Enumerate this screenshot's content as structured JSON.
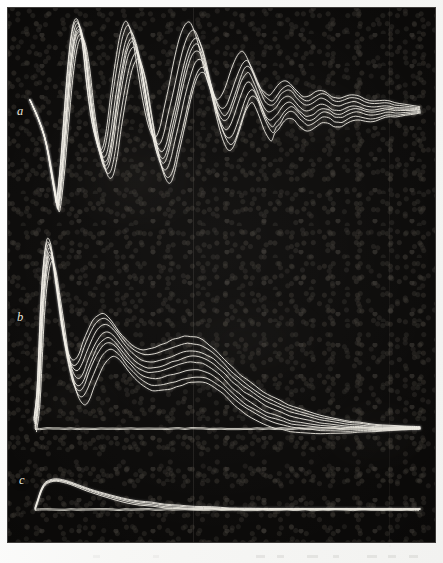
{
  "figure": {
    "kind": "photographic-oscilloscope-plate",
    "background_color": "#0a0908",
    "trace_color": "#f2efe6",
    "paper_color": "#fbfbfa",
    "plate": {
      "x": 8,
      "y": 8,
      "width": 427,
      "height": 534
    },
    "panels": [
      {
        "id": "a",
        "label": "a"
      },
      {
        "id": "b",
        "label": "b"
      },
      {
        "id": "c",
        "label": "c"
      }
    ]
  },
  "chart_data": {
    "type": "line",
    "title": "",
    "subtitle": "",
    "xlabel": "",
    "ylabel": "",
    "grid": false,
    "legend": "none",
    "panels": [
      {
        "id": "a",
        "label": "a",
        "sweeps": 8,
        "baseline_y": 110,
        "xlim": [
          30,
          420
        ],
        "ylim": [
          10,
          215
        ],
        "note": "damped ringing, ~5 visible full cycles then fine ripple",
        "points": [
          [
            30,
            100
          ],
          [
            38,
            118
          ],
          [
            44,
            135
          ],
          [
            48,
            152
          ],
          [
            52,
            175
          ],
          [
            56,
            198
          ],
          [
            58,
            205
          ],
          [
            62,
            170
          ],
          [
            66,
            120
          ],
          [
            70,
            72
          ],
          [
            74,
            40
          ],
          [
            78,
            28
          ],
          [
            82,
            34
          ],
          [
            86,
            58
          ],
          [
            90,
            95
          ],
          [
            95,
            130
          ],
          [
            100,
            152
          ],
          [
            104,
            163
          ],
          [
            108,
            160
          ],
          [
            112,
            140
          ],
          [
            116,
            110
          ],
          [
            121,
            78
          ],
          [
            126,
            52
          ],
          [
            131,
            40
          ],
          [
            135,
            44
          ],
          [
            140,
            62
          ],
          [
            145,
            92
          ],
          [
            150,
            122
          ],
          [
            155,
            145
          ],
          [
            160,
            158
          ],
          [
            164,
            160
          ],
          [
            168,
            150
          ],
          [
            172,
            132
          ],
          [
            177,
            110
          ],
          [
            182,
            86
          ],
          [
            187,
            66
          ],
          [
            192,
            52
          ],
          [
            197,
            48
          ],
          [
            201,
            54
          ],
          [
            206,
            70
          ],
          [
            211,
            92
          ],
          [
            216,
            110
          ],
          [
            221,
            122
          ],
          [
            225,
            126
          ],
          [
            229,
            122
          ],
          [
            233,
            112
          ],
          [
            237,
            100
          ],
          [
            241,
            88
          ],
          [
            245,
            80
          ],
          [
            249,
            78
          ],
          [
            253,
            84
          ],
          [
            257,
            94
          ],
          [
            261,
            104
          ],
          [
            265,
            112
          ],
          [
            269,
            116
          ],
          [
            273,
            114
          ],
          [
            277,
            110
          ],
          [
            281,
            104
          ],
          [
            285,
            100
          ],
          [
            289,
            99
          ],
          [
            293,
            101
          ],
          [
            297,
            106
          ],
          [
            301,
            110
          ],
          [
            305,
            113
          ],
          [
            309,
            113
          ],
          [
            313,
            111
          ],
          [
            317,
            108
          ],
          [
            321,
            106
          ],
          [
            325,
            106
          ],
          [
            329,
            108
          ],
          [
            333,
            111
          ],
          [
            337,
            112
          ],
          [
            341,
            112
          ],
          [
            345,
            110
          ],
          [
            350,
            108
          ],
          [
            355,
            107
          ],
          [
            360,
            108
          ],
          [
            365,
            110
          ],
          [
            370,
            111
          ],
          [
            375,
            111
          ],
          [
            380,
            110
          ],
          [
            385,
            109
          ],
          [
            390,
            109
          ],
          [
            395,
            110
          ],
          [
            400,
            110
          ],
          [
            405,
            110
          ],
          [
            410,
            110
          ],
          [
            415,
            110
          ],
          [
            420,
            110
          ]
        ]
      },
      {
        "id": "b",
        "label": "b",
        "sweeps": 8,
        "baseline_y": 428,
        "xlim": [
          35,
          420
        ],
        "ylim": [
          245,
          430
        ],
        "note": "large initial spike, damped secondary humps, long exponential decay to baseline",
        "points": [
          [
            35,
            425
          ],
          [
            38,
            400
          ],
          [
            40,
            360
          ],
          [
            42,
            315
          ],
          [
            44,
            285
          ],
          [
            46,
            265
          ],
          [
            48,
            253
          ],
          [
            50,
            250
          ],
          [
            53,
            258
          ],
          [
            56,
            278
          ],
          [
            60,
            305
          ],
          [
            64,
            334
          ],
          [
            68,
            356
          ],
          [
            72,
            372
          ],
          [
            76,
            380
          ],
          [
            80,
            381
          ],
          [
            84,
            375
          ],
          [
            88,
            364
          ],
          [
            93,
            352
          ],
          [
            98,
            342
          ],
          [
            103,
            336
          ],
          [
            108,
            334
          ],
          [
            113,
            337
          ],
          [
            118,
            343
          ],
          [
            124,
            351
          ],
          [
            130,
            358
          ],
          [
            136,
            364
          ],
          [
            142,
            368
          ],
          [
            148,
            370
          ],
          [
            154,
            370
          ],
          [
            160,
            369
          ],
          [
            166,
            367
          ],
          [
            172,
            365
          ],
          [
            178,
            363
          ],
          [
            184,
            361
          ],
          [
            190,
            360
          ],
          [
            196,
            360
          ],
          [
            202,
            361
          ],
          [
            208,
            364
          ],
          [
            214,
            368
          ],
          [
            220,
            373
          ],
          [
            226,
            379
          ],
          [
            232,
            385
          ],
          [
            238,
            390
          ],
          [
            244,
            395
          ],
          [
            250,
            399
          ],
          [
            258,
            404
          ],
          [
            266,
            409
          ],
          [
            274,
            412
          ],
          [
            282,
            415
          ],
          [
            290,
            418
          ],
          [
            300,
            420
          ],
          [
            310,
            422
          ],
          [
            320,
            424
          ],
          [
            330,
            425
          ],
          [
            340,
            426
          ],
          [
            350,
            427
          ],
          [
            360,
            427
          ],
          [
            375,
            428
          ],
          [
            390,
            428
          ],
          [
            405,
            428
          ],
          [
            420,
            428
          ]
        ]
      },
      {
        "id": "c",
        "label": "c",
        "sweeps": 4,
        "baseline_y": 509,
        "xlim": [
          35,
          420
        ],
        "ylim": [
          478,
          512
        ],
        "note": "small slow rounded pulse relaxing back onto baseline",
        "points": [
          [
            35,
            509
          ],
          [
            38,
            500
          ],
          [
            41,
            491
          ],
          [
            45,
            484
          ],
          [
            50,
            481
          ],
          [
            56,
            480
          ],
          [
            63,
            481
          ],
          [
            70,
            483
          ],
          [
            78,
            486
          ],
          [
            86,
            489
          ],
          [
            95,
            492
          ],
          [
            105,
            495
          ],
          [
            116,
            498
          ],
          [
            128,
            501
          ],
          [
            140,
            503
          ],
          [
            152,
            504
          ],
          [
            165,
            506
          ],
          [
            180,
            507
          ],
          [
            195,
            508
          ],
          [
            212,
            508
          ],
          [
            230,
            509
          ],
          [
            250,
            509
          ],
          [
            275,
            509
          ],
          [
            300,
            509
          ],
          [
            330,
            509
          ],
          [
            360,
            509
          ],
          [
            390,
            509
          ],
          [
            420,
            509
          ]
        ]
      }
    ],
    "baselines": [
      {
        "panel": "b",
        "y": 428,
        "x0": 35,
        "x1": 420
      },
      {
        "panel": "c",
        "y": 509,
        "x0": 35,
        "x1": 420
      }
    ]
  }
}
